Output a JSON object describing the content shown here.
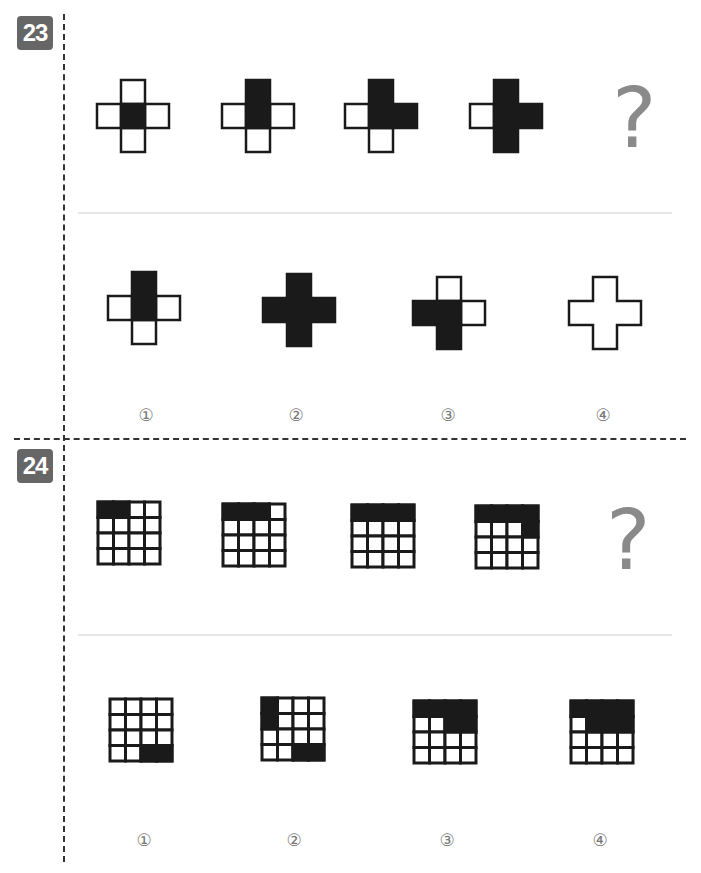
{
  "questions": [
    {
      "number": "23",
      "type": "cross",
      "question_mark": "?",
      "sequence": [
        {
          "black": [
            "center"
          ]
        },
        {
          "black": [
            "center",
            "top"
          ]
        },
        {
          "black": [
            "center",
            "top",
            "right"
          ]
        },
        {
          "black": [
            "center",
            "top",
            "right",
            "bottom"
          ]
        }
      ],
      "options": [
        {
          "label": "①",
          "black": [
            "top",
            "center"
          ],
          "outline_only": false
        },
        {
          "label": "②",
          "black": [
            "top",
            "left",
            "center",
            "right",
            "bottom"
          ],
          "outline_only": false
        },
        {
          "label": "③",
          "black": [
            "left",
            "center",
            "bottom"
          ],
          "outline_only": false
        },
        {
          "label": "④",
          "black": [],
          "outline_only": true
        }
      ]
    },
    {
      "number": "24",
      "type": "grid4x4",
      "question_mark": "?",
      "sequence": [
        {
          "black": [
            [
              0,
              0
            ],
            [
              0,
              1
            ]
          ]
        },
        {
          "black": [
            [
              0,
              0
            ],
            [
              0,
              1
            ],
            [
              0,
              2
            ]
          ]
        },
        {
          "black": [
            [
              0,
              0
            ],
            [
              0,
              1
            ],
            [
              0,
              2
            ],
            [
              0,
              3
            ]
          ]
        },
        {
          "black": [
            [
              0,
              0
            ],
            [
              0,
              1
            ],
            [
              0,
              2
            ],
            [
              0,
              3
            ],
            [
              1,
              3
            ]
          ]
        }
      ],
      "options": [
        {
          "label": "①",
          "black": [
            [
              3,
              2
            ],
            [
              3,
              3
            ]
          ]
        },
        {
          "label": "②",
          "black": [
            [
              0,
              0
            ],
            [
              1,
              0
            ],
            [
              3,
              2
            ],
            [
              3,
              3
            ]
          ]
        },
        {
          "label": "③",
          "black": [
            [
              0,
              0
            ],
            [
              0,
              1
            ],
            [
              0,
              2
            ],
            [
              0,
              3
            ],
            [
              1,
              2
            ],
            [
              1,
              3
            ]
          ]
        },
        {
          "label": "④",
          "black": [
            [
              0,
              0
            ],
            [
              0,
              1
            ],
            [
              0,
              2
            ],
            [
              0,
              3
            ],
            [
              1,
              1
            ],
            [
              1,
              2
            ],
            [
              1,
              3
            ]
          ]
        }
      ]
    }
  ],
  "colors": {
    "fill": "#1a1a1a",
    "stroke": "#1a1a1a",
    "badge": "#666666",
    "question_mark": "#8a8a8a",
    "label": "#777777"
  }
}
